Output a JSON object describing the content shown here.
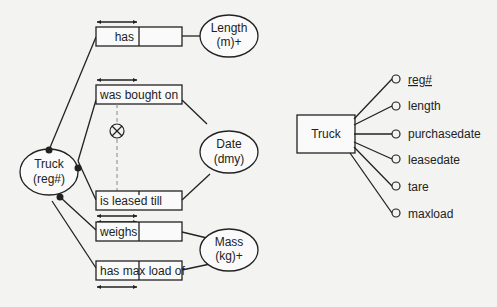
{
  "orm_diagram": {
    "entity": {
      "name": "Truck",
      "ref": "(reg#)"
    },
    "value_types": [
      {
        "name": "Length",
        "ref": "(m)+"
      },
      {
        "name": "Date",
        "ref": "(dmy)"
      },
      {
        "name": "Mass",
        "ref": "(kg)+"
      }
    ],
    "fact_types": [
      {
        "reading": "has",
        "target": "Length"
      },
      {
        "reading": "was bought on",
        "target": "Date"
      },
      {
        "reading": "is leased till",
        "target": "Date"
      },
      {
        "reading": "weighs",
        "target": "Mass"
      },
      {
        "reading": "has max load of",
        "target": "Mass"
      }
    ],
    "exclusion_symbol": "⊗"
  },
  "er_diagram": {
    "entity": "Truck",
    "attributes": [
      {
        "name": "reg#",
        "identifier": true
      },
      {
        "name": "length",
        "identifier": false
      },
      {
        "name": "purchasedate",
        "identifier": false
      },
      {
        "name": "leasedate",
        "identifier": false
      },
      {
        "name": "tare",
        "identifier": false
      },
      {
        "name": "maxload",
        "identifier": false
      }
    ]
  },
  "colors": {
    "ink": "#222222",
    "background": "#f3f3f1"
  }
}
